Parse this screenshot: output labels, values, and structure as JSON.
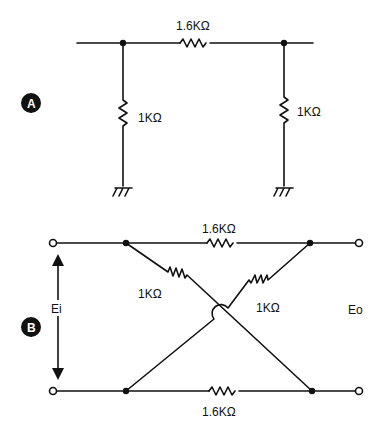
{
  "figure_a": {
    "badge": "A",
    "series_resistor": "1.6KΩ",
    "left_shunt_resistor": "1KΩ",
    "right_shunt_resistor": "1KΩ"
  },
  "figure_b": {
    "badge": "B",
    "top_resistor": "1.6KΩ",
    "bottom_resistor": "1.6KΩ",
    "cross_left_resistor": "1KΩ",
    "cross_right_resistor": "1KΩ",
    "input_label": "Ei",
    "output_label": "Eo"
  }
}
